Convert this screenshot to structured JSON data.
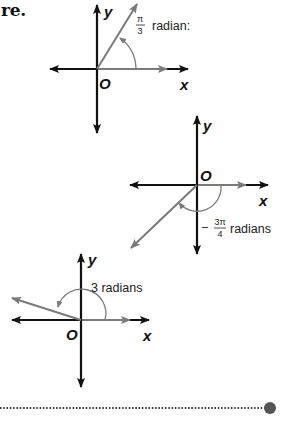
{
  "heading": "re.",
  "colors": {
    "axis": "#111111",
    "ray": "#7a7a7a",
    "dot": "#555555"
  },
  "diagrams": [
    {
      "id": "angle-pi-over-3",
      "x_label": "x",
      "y_label": "y",
      "origin_label": "O",
      "angle_numerator": "π",
      "angle_denominator": "3",
      "angle_prefix": "",
      "angle_unit": "radian:",
      "angle_radians": 1.0472
    },
    {
      "id": "angle-neg-3pi-over-4",
      "x_label": "x",
      "y_label": "y",
      "origin_label": "O",
      "angle_numerator": "3π",
      "angle_denominator": "4",
      "angle_prefix": "−",
      "angle_unit": "radians",
      "angle_radians": -2.3562
    },
    {
      "id": "angle-3-radians",
      "x_label": "x",
      "y_label": "y",
      "origin_label": "O",
      "angle_text": "3 radians",
      "angle_radians": 3
    }
  ]
}
